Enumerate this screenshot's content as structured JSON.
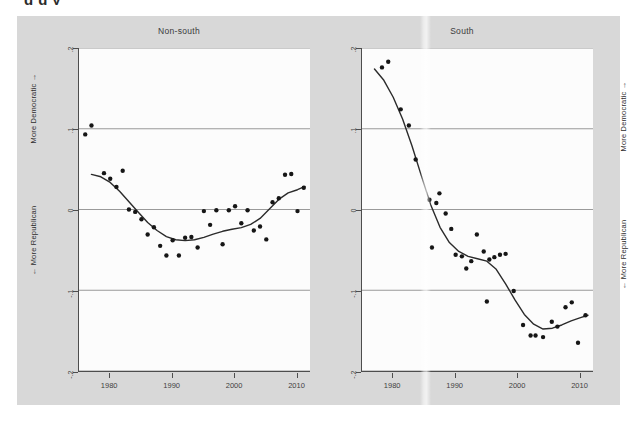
{
  "figure": {
    "cropped_heading_fragment": "g g y",
    "background_color": "#d8d8d8",
    "plot_background_color": "#fcfcfc",
    "axis_color": "#4d4d4d",
    "grid_color": "#8f8f8f",
    "marker_color": "#161616",
    "fit_line_color": "#2b2b2b"
  },
  "axis_titles": {
    "more_democratic": "More Democratic →",
    "more_republican": "← More Republican"
  },
  "chart_data": [
    {
      "type": "scatter",
      "title": "Non-south",
      "xlabel": "",
      "ylabel": "More Democratic / More Republican",
      "xlim": [
        1975,
        2012
      ],
      "ylim": [
        -0.2,
        0.2
      ],
      "xticks": [
        1980,
        1990,
        2000,
        2010
      ],
      "xticklabels": [
        "1980",
        "1990",
        "2000",
        "2010"
      ],
      "yticks": [
        0.2,
        0.1,
        0.0,
        -0.1,
        -0.2
      ],
      "yticklabels": [
        ".2",
        ".1",
        "0",
        "-.1",
        "-.2"
      ],
      "grid": "horizontal",
      "legend": "none",
      "points": [
        {
          "x": 1976,
          "y": 0.093
        },
        {
          "x": 1977,
          "y": 0.104
        },
        {
          "x": 1979,
          "y": 0.045
        },
        {
          "x": 1980,
          "y": 0.038
        },
        {
          "x": 1981,
          "y": 0.028
        },
        {
          "x": 1982,
          "y": 0.048
        },
        {
          "x": 1983,
          "y": 0.0
        },
        {
          "x": 1984,
          "y": -0.003
        },
        {
          "x": 1985,
          "y": -0.012
        },
        {
          "x": 1986,
          "y": -0.031
        },
        {
          "x": 1987,
          "y": -0.022
        },
        {
          "x": 1988,
          "y": -0.045
        },
        {
          "x": 1989,
          "y": -0.057
        },
        {
          "x": 1990,
          "y": -0.038
        },
        {
          "x": 1991,
          "y": -0.057
        },
        {
          "x": 1992,
          "y": -0.035
        },
        {
          "x": 1993,
          "y": -0.034
        },
        {
          "x": 1994,
          "y": -0.047
        },
        {
          "x": 1995,
          "y": -0.002
        },
        {
          "x": 1996,
          "y": -0.019
        },
        {
          "x": 1997,
          "y": -0.001
        },
        {
          "x": 1998,
          "y": -0.043
        },
        {
          "x": 1999,
          "y": -0.001
        },
        {
          "x": 2000,
          "y": 0.004
        },
        {
          "x": 2001,
          "y": -0.017
        },
        {
          "x": 2002,
          "y": -0.001
        },
        {
          "x": 2003,
          "y": -0.026
        },
        {
          "x": 2004,
          "y": -0.021
        },
        {
          "x": 2005,
          "y": -0.037
        },
        {
          "x": 2006,
          "y": 0.009
        },
        {
          "x": 2007,
          "y": 0.014
        },
        {
          "x": 2008,
          "y": 0.043
        },
        {
          "x": 2009,
          "y": 0.044
        },
        {
          "x": 2010,
          "y": -0.002
        },
        {
          "x": 2011,
          "y": 0.027
        }
      ],
      "fit_line": [
        {
          "x": 1977.0,
          "y": 0.0435
        },
        {
          "x": 1978.5,
          "y": 0.0405
        },
        {
          "x": 1980.0,
          "y": 0.0335
        },
        {
          "x": 1981.5,
          "y": 0.0225
        },
        {
          "x": 1983.0,
          "y": 0.0095
        },
        {
          "x": 1984.5,
          "y": -0.0035
        },
        {
          "x": 1986.0,
          "y": -0.016
        },
        {
          "x": 1987.5,
          "y": -0.026
        },
        {
          "x": 1989.0,
          "y": -0.0335
        },
        {
          "x": 1990.5,
          "y": -0.0375
        },
        {
          "x": 1992.0,
          "y": -0.0385
        },
        {
          "x": 1993.5,
          "y": -0.0375
        },
        {
          "x": 1995.0,
          "y": -0.0345
        },
        {
          "x": 1996.5,
          "y": -0.0305
        },
        {
          "x": 1998.0,
          "y": -0.027
        },
        {
          "x": 1999.5,
          "y": -0.0245
        },
        {
          "x": 2001.0,
          "y": -0.0225
        },
        {
          "x": 2002.5,
          "y": -0.0185
        },
        {
          "x": 2004.0,
          "y": -0.011
        },
        {
          "x": 2005.5,
          "y": 0.0005
        },
        {
          "x": 2007.0,
          "y": 0.0125
        },
        {
          "x": 2008.5,
          "y": 0.0205
        },
        {
          "x": 2010.0,
          "y": 0.0245
        },
        {
          "x": 2011.2,
          "y": 0.0285
        }
      ]
    },
    {
      "type": "scatter",
      "title": "South",
      "xlabel": "",
      "ylabel": "More Democratic / More Republican",
      "xlim": [
        1975,
        2012
      ],
      "ylim": [
        -0.2,
        0.2
      ],
      "xticks": [
        1980,
        1990,
        2000,
        2010
      ],
      "xticklabels": [
        "1980",
        "1990",
        "2000",
        "2010"
      ],
      "yticks": [
        0.2,
        0.1,
        0.0,
        -0.1,
        -0.2
      ],
      "yticklabels": [
        ".2",
        ".1",
        "0",
        "-.1",
        "-.2"
      ],
      "grid": "horizontal",
      "legend": "none",
      "points": [
        {
          "x": 1975.7,
          "y": 0.228
        },
        {
          "x": 1976.7,
          "y": 0.221
        },
        {
          "x": 1978.2,
          "y": 0.176
        },
        {
          "x": 1979.2,
          "y": 0.183
        },
        {
          "x": 1981.2,
          "y": 0.124
        },
        {
          "x": 1982.5,
          "y": 0.104
        },
        {
          "x": 1983.6,
          "y": 0.062
        },
        {
          "x": 1985.8,
          "y": 0.012
        },
        {
          "x": 1986.9,
          "y": 0.008
        },
        {
          "x": 1987.4,
          "y": 0.02
        },
        {
          "x": 1988.4,
          "y": -0.005
        },
        {
          "x": 1986.2,
          "y": -0.047
        },
        {
          "x": 1989.3,
          "y": -0.024
        },
        {
          "x": 1990.0,
          "y": -0.056
        },
        {
          "x": 1991.0,
          "y": -0.058
        },
        {
          "x": 1991.7,
          "y": -0.073
        },
        {
          "x": 1992.5,
          "y": -0.064
        },
        {
          "x": 1993.4,
          "y": -0.031
        },
        {
          "x": 1994.5,
          "y": -0.052
        },
        {
          "x": 1995.4,
          "y": -0.062
        },
        {
          "x": 1996.2,
          "y": -0.059
        },
        {
          "x": 1997.1,
          "y": -0.056
        },
        {
          "x": 1998.0,
          "y": -0.055
        },
        {
          "x": 1995.0,
          "y": -0.114
        },
        {
          "x": 1999.3,
          "y": -0.101
        },
        {
          "x": 2000.8,
          "y": -0.143
        },
        {
          "x": 2002.0,
          "y": -0.156
        },
        {
          "x": 2002.8,
          "y": -0.156
        },
        {
          "x": 2004.0,
          "y": -0.158
        },
        {
          "x": 2005.4,
          "y": -0.139
        },
        {
          "x": 2006.3,
          "y": -0.145
        },
        {
          "x": 2007.6,
          "y": -0.121
        },
        {
          "x": 2008.6,
          "y": -0.115
        },
        {
          "x": 2009.6,
          "y": -0.165
        },
        {
          "x": 2010.8,
          "y": -0.131
        }
      ],
      "fit_line": [
        {
          "x": 1977.0,
          "y": 0.174
        },
        {
          "x": 1978.5,
          "y": 0.16
        },
        {
          "x": 1980.0,
          "y": 0.139
        },
        {
          "x": 1981.5,
          "y": 0.112
        },
        {
          "x": 1983.0,
          "y": 0.079
        },
        {
          "x": 1984.5,
          "y": 0.042
        },
        {
          "x": 1986.0,
          "y": 0.006
        },
        {
          "x": 1987.5,
          "y": -0.022
        },
        {
          "x": 1989.0,
          "y": -0.041
        },
        {
          "x": 1990.5,
          "y": -0.052
        },
        {
          "x": 1992.0,
          "y": -0.058
        },
        {
          "x": 1993.5,
          "y": -0.061
        },
        {
          "x": 1995.0,
          "y": -0.064
        },
        {
          "x": 1996.5,
          "y": -0.074
        },
        {
          "x": 1998.0,
          "y": -0.092
        },
        {
          "x": 1999.5,
          "y": -0.112
        },
        {
          "x": 2001.0,
          "y": -0.13
        },
        {
          "x": 2002.5,
          "y": -0.142
        },
        {
          "x": 2004.0,
          "y": -0.148
        },
        {
          "x": 2005.5,
          "y": -0.147
        },
        {
          "x": 2007.0,
          "y": -0.143
        },
        {
          "x": 2008.5,
          "y": -0.138
        },
        {
          "x": 2010.0,
          "y": -0.134
        },
        {
          "x": 2011.2,
          "y": -0.131
        }
      ]
    }
  ]
}
